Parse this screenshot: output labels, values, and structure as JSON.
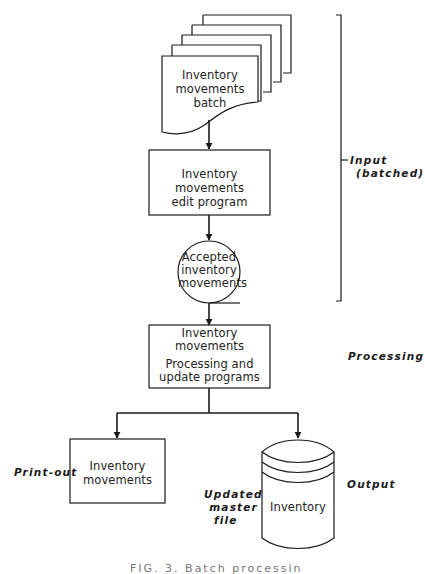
{
  "diagram": {
    "type": "flowchart",
    "nodes": {
      "batch": {
        "shape": "document-stack",
        "label_line1": "Inventory",
        "label_line2": "movements batch"
      },
      "edit": {
        "shape": "process-box",
        "label_line1": "Inventory movements",
        "label_line2": "edit program"
      },
      "accepted": {
        "shape": "magnetic-tape-circle",
        "label_line1": "Accepted",
        "label_line2": "inventory",
        "label_line3": "movements"
      },
      "processing": {
        "shape": "process-box",
        "label_line1": "Inventory",
        "label_line2": "movements",
        "label_line3": "Processing and",
        "label_line4": "update programs"
      },
      "printout": {
        "shape": "box",
        "label_line1": "Inventory",
        "label_line2": "movements"
      },
      "master": {
        "shape": "disk-cylinder",
        "label": "Inventory"
      }
    },
    "edges": [
      [
        "batch",
        "edit"
      ],
      [
        "edit",
        "accepted"
      ],
      [
        "accepted",
        "processing"
      ],
      [
        "processing",
        "printout"
      ],
      [
        "processing",
        "master"
      ]
    ],
    "annotations": {
      "input": "Input",
      "input_sub": "(batched)",
      "processing": "Processing",
      "output": "Output",
      "printout": "Print-out",
      "master_line1": "Updated",
      "master_line2": "master",
      "master_line3": "file"
    },
    "caption": "FIG. 3. Batch processing"
  }
}
